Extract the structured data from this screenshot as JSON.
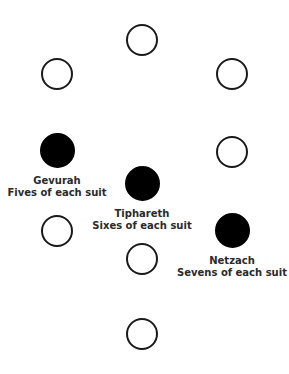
{
  "diagram": {
    "title": "",
    "nodes": [
      {
        "id": "top",
        "cx": 142,
        "cy": 40,
        "filled": false
      },
      {
        "id": "upper-left",
        "cx": 57,
        "cy": 74,
        "filled": false
      },
      {
        "id": "upper-right",
        "cx": 232,
        "cy": 74,
        "filled": false
      },
      {
        "id": "gevurah",
        "cx": 57,
        "cy": 151,
        "filled": true,
        "name": "Gevurah",
        "desc": "Fives of each suit"
      },
      {
        "id": "middle-right",
        "cx": 232,
        "cy": 152,
        "filled": false
      },
      {
        "id": "tiphareth",
        "cx": 142,
        "cy": 184,
        "filled": true,
        "name": "Tiphareth",
        "desc": "Sixes of each suit"
      },
      {
        "id": "lower-left",
        "cx": 57,
        "cy": 231,
        "filled": false
      },
      {
        "id": "netzach",
        "cx": 232,
        "cy": 231,
        "filled": true,
        "name": "Netzach",
        "desc": "Sevens of each suit"
      },
      {
        "id": "lower-center",
        "cx": 142,
        "cy": 259,
        "filled": false
      },
      {
        "id": "bottom",
        "cx": 142,
        "cy": 334,
        "filled": false
      }
    ],
    "labels": {
      "gevurah": {
        "name": "Gevurah",
        "desc": "Fives of each suit"
      },
      "tiphareth": {
        "name": "Tiphareth",
        "desc": "Sixes of each suit"
      },
      "netzach": {
        "name": "Netzach",
        "desc": "Sevens of each suit"
      }
    },
    "colors": {
      "filled": "#000000",
      "outline": "#1a1a1a",
      "background": "#ffffff"
    }
  }
}
